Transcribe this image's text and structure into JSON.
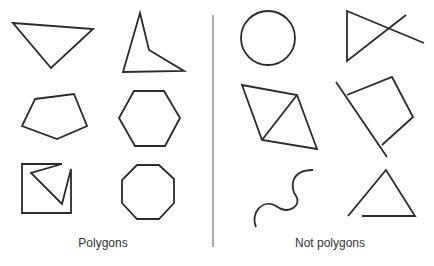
{
  "diagram": {
    "groups": [
      {
        "label": "Polygons",
        "shapes": [
          {
            "name": "triangle",
            "description": "triangle"
          },
          {
            "name": "concave-quadrilateral",
            "description": "concave quadrilateral (arrowhead)"
          },
          {
            "name": "pentagon",
            "description": "irregular pentagon"
          },
          {
            "name": "hexagon",
            "description": "regular hexagon"
          },
          {
            "name": "concave-polygon-in-square",
            "description": "concave polygon with notch inside square outline"
          },
          {
            "name": "octagon",
            "description": "regular octagon"
          }
        ]
      },
      {
        "label": "Not polygons",
        "shapes": [
          {
            "name": "circle",
            "description": "circle (curved)"
          },
          {
            "name": "crossed-lines-shape",
            "description": "sides extend past intersection"
          },
          {
            "name": "quadrilateral-with-diagonal",
            "description": "quadrilateral with interior diagonal"
          },
          {
            "name": "shape-with-extended-side",
            "description": "side extends beyond vertices"
          },
          {
            "name": "wavy-curve",
            "description": "open curve"
          },
          {
            "name": "open-triangle",
            "description": "sides do not meet (not closed)"
          }
        ]
      }
    ],
    "colors": {
      "stroke": "#2b2b2b",
      "background": "#ffffff",
      "divider": "#555555"
    }
  }
}
